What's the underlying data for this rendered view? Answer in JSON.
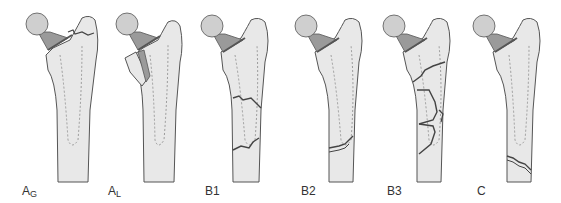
{
  "diagram": {
    "colors": {
      "bone_fill": "#e8e8e8",
      "bone_outline": "#555555",
      "stem_dashed": "#888888",
      "head_fill": "#cfcfcf",
      "neck_fill": "#9a9a9a",
      "fracture_line": "#444444"
    },
    "panels": [
      {
        "id": "AG",
        "label_main": "A",
        "label_sub": "G",
        "description": "Greater trochanter fracture"
      },
      {
        "id": "AL",
        "label_main": "A",
        "label_sub": "L",
        "description": "Lesser trochanter fracture"
      },
      {
        "id": "B1",
        "label_main": "B1",
        "label_sub": "",
        "description": "Fracture around stem, stable implant"
      },
      {
        "id": "B2",
        "label_main": "B2",
        "label_sub": "",
        "description": "Fracture around stem tip, loose implant"
      },
      {
        "id": "B3",
        "label_main": "B3",
        "label_sub": "",
        "description": "Comminuted fracture, poor bone stock"
      },
      {
        "id": "C",
        "label_main": "C",
        "label_sub": "",
        "description": "Fracture well below stem"
      }
    ]
  }
}
